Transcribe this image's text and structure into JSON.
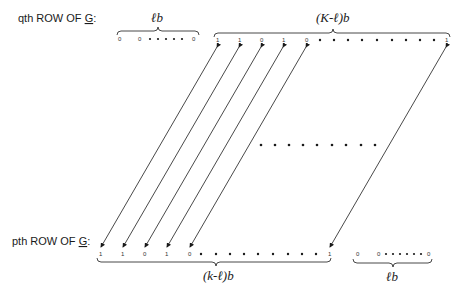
{
  "labels": {
    "top_row": "qth ROW OF ",
    "top_row_matrix": "G",
    "top_row_colon": ":",
    "bottom_row": "pth ROW OF ",
    "bottom_row_matrix": "G",
    "bottom_row_colon": ":"
  },
  "braces": {
    "top_left": "ℓb",
    "top_right": "(K-ℓ)b",
    "bottom_left": "(k-ℓ)b",
    "bottom_right": "ℓb"
  },
  "bits": {
    "top_left": [
      "0",
      "0",
      "0"
    ],
    "top_right": [
      "1",
      "1",
      "0",
      "1",
      "0",
      "1"
    ],
    "bottom_left": [
      "1",
      "1",
      "0",
      "1",
      "0",
      "1"
    ],
    "bottom_right": [
      "0",
      "0",
      "0"
    ]
  },
  "colors": {
    "ink": "#1a1a1a",
    "background": "#ffffff"
  }
}
